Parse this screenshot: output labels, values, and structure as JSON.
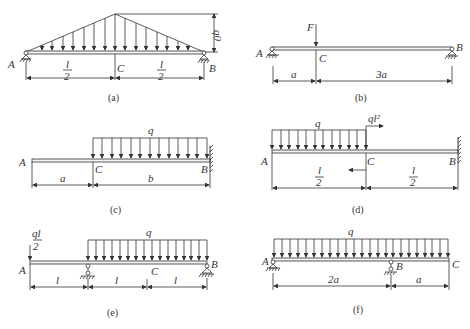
{
  "figures": [
    {
      "id": "a",
      "caption": "(a)",
      "labels": {
        "left": "A",
        "mid": "C",
        "right": "B",
        "load": "q0",
        "dim1": "l/2",
        "dim2": "l/2"
      },
      "load_type": "triangular distributed, peak q0 at C",
      "supports": {
        "A": "pin",
        "B": "roller"
      }
    },
    {
      "id": "b",
      "caption": "(b)",
      "labels": {
        "left": "A",
        "mid": "C",
        "right": "B",
        "force": "F",
        "dim1": "a",
        "dim2": "3a"
      },
      "load_type": "point load F at C",
      "supports": {
        "A": "pin",
        "B": "roller"
      }
    },
    {
      "id": "c",
      "caption": "(c)",
      "labels": {
        "left": "A",
        "mid": "C",
        "right": "B",
        "load": "q",
        "dim1": "a",
        "dim2": "b"
      },
      "load_type": "uniform q over CB",
      "supports": {
        "B": "fixed"
      }
    },
    {
      "id": "d",
      "caption": "(d)",
      "labels": {
        "left": "A",
        "mid": "C",
        "right": "B",
        "load": "q",
        "moment": "ql²",
        "dim1": "l/2",
        "dim2": "l/2"
      },
      "load_type": "uniform q over AC, couple ql² at C",
      "supports": {
        "B": "fixed"
      }
    },
    {
      "id": "e",
      "caption": "(e)",
      "labels": {
        "left": "A",
        "mid": "C",
        "right": "B",
        "load": "q",
        "force": "ql/2",
        "dim1": "l",
        "dim2": "l",
        "dim3": "l"
      },
      "load_type": "point ql/2 at A, uniform q from support to B",
      "supports": {
        "D": "roller",
        "B": "pin"
      }
    },
    {
      "id": "f",
      "caption": "(f)",
      "labels": {
        "left": "A",
        "mid": "B",
        "right": "C",
        "load": "q",
        "dim1": "2a",
        "dim2": "a"
      },
      "load_type": "uniform q over AC",
      "supports": {
        "A": "pin",
        "B": "roller"
      }
    }
  ]
}
